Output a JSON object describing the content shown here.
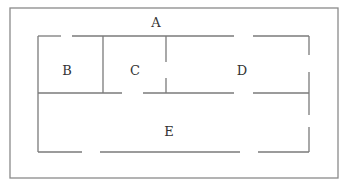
{
  "diagram": {
    "type": "floor-plan",
    "colors": {
      "outer_border": "#8a8a8a",
      "walls": "#7a7a7a",
      "label": "#333333",
      "background": "#ffffff"
    },
    "regions": [
      {
        "id": "A",
        "label": "A",
        "x": 156,
        "y": 23
      },
      {
        "id": "B",
        "label": "B",
        "x": 67,
        "y": 71
      },
      {
        "id": "C",
        "label": "C",
        "x": 135,
        "y": 71
      },
      {
        "id": "D",
        "label": "D",
        "x": 242,
        "y": 71
      },
      {
        "id": "E",
        "label": "E",
        "x": 169,
        "y": 132
      }
    ],
    "outer_border": {
      "x": 10,
      "y": 8,
      "width": 328,
      "height": 170
    },
    "walls": [
      {
        "name": "top-wall-1",
        "x1": 38,
        "y1": 36,
        "x2": 61,
        "y2": 36
      },
      {
        "name": "top-wall-2",
        "x1": 72,
        "y1": 36,
        "x2": 234,
        "y2": 36
      },
      {
        "name": "top-wall-3",
        "x1": 253,
        "y1": 36,
        "x2": 309,
        "y2": 36
      },
      {
        "name": "left-wall",
        "x1": 38,
        "y1": 36,
        "x2": 38,
        "y2": 152
      },
      {
        "name": "right-wall-1",
        "x1": 309,
        "y1": 36,
        "x2": 309,
        "y2": 55
      },
      {
        "name": "right-wall-2",
        "x1": 309,
        "y1": 72,
        "x2": 309,
        "y2": 115
      },
      {
        "name": "right-wall-3",
        "x1": 309,
        "y1": 127,
        "x2": 309,
        "y2": 152
      },
      {
        "name": "middle-wall-1",
        "x1": 38,
        "y1": 93,
        "x2": 122,
        "y2": 93
      },
      {
        "name": "middle-wall-2",
        "x1": 143,
        "y1": 93,
        "x2": 234,
        "y2": 93
      },
      {
        "name": "middle-wall-3",
        "x1": 253,
        "y1": 93,
        "x2": 309,
        "y2": 93
      },
      {
        "name": "bottom-wall-1",
        "x1": 38,
        "y1": 152,
        "x2": 82,
        "y2": 152
      },
      {
        "name": "bottom-wall-2",
        "x1": 100,
        "y1": 152,
        "x2": 240,
        "y2": 152
      },
      {
        "name": "bottom-wall-3",
        "x1": 258,
        "y1": 152,
        "x2": 309,
        "y2": 152
      },
      {
        "name": "bc-divider",
        "x1": 103,
        "y1": 36,
        "x2": 103,
        "y2": 93
      },
      {
        "name": "cd-divider-1",
        "x1": 166,
        "y1": 36,
        "x2": 166,
        "y2": 62
      },
      {
        "name": "cd-divider-2",
        "x1": 166,
        "y1": 78,
        "x2": 166,
        "y2": 93
      }
    ]
  }
}
